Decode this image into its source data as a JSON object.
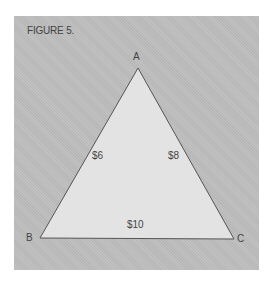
{
  "figure": {
    "title": "FIGURE 5.",
    "vertices": [
      {
        "name": "A",
        "x": 138,
        "y": 68
      },
      {
        "name": "B",
        "x": 40,
        "y": 238
      },
      {
        "name": "C",
        "x": 234,
        "y": 239
      }
    ],
    "edges": [
      {
        "from": "A",
        "to": "B",
        "label": "$6"
      },
      {
        "from": "A",
        "to": "C",
        "label": "$8"
      },
      {
        "from": "B",
        "to": "C",
        "label": "$10"
      }
    ],
    "colors": {
      "background": "#bdbdbd",
      "triangle_fill": "#e3e3e3",
      "stroke": "#555555",
      "text": "#444444"
    }
  }
}
